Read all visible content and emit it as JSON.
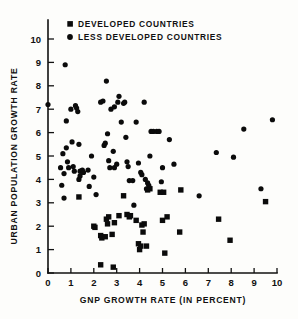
{
  "chart_data": {
    "type": "scatter",
    "title": "",
    "xlabel": "GNP GROWTH RATE  (IN PERCENT)",
    "ylabel": "URBAN POPULATION GROWTH RATE",
    "xlim": [
      0,
      10
    ],
    "ylim": [
      0,
      10.8
    ],
    "xticks": [
      "0",
      "1",
      "2",
      "3",
      "4",
      "5",
      "6",
      "7",
      "8",
      "9",
      "10"
    ],
    "xtick_values": [
      0,
      1,
      2,
      3,
      4,
      5,
      6,
      7,
      8,
      9,
      10
    ],
    "yticks": [
      "0",
      "1",
      "2",
      "3",
      "4",
      "5",
      "6",
      "7",
      "8",
      "9",
      "10"
    ],
    "ytick_values": [
      0,
      1,
      2,
      3,
      4,
      5,
      6,
      7,
      8,
      9,
      10
    ],
    "grid": false,
    "legend_position": "top-center",
    "marker_colors": {
      "developed": "#0b0b0b",
      "less_developed": "#0b0b0b"
    },
    "series": [
      {
        "name": "DEVELOPED COUNTRIES",
        "marker": "square",
        "color": "#0b0b0b",
        "points": [
          [
            1.35,
            3.25
          ],
          [
            2.0,
            2.0
          ],
          [
            2.05,
            1.95
          ],
          [
            2.3,
            0.35
          ],
          [
            2.3,
            1.6
          ],
          [
            2.35,
            1.5
          ],
          [
            2.5,
            1.55
          ],
          [
            2.55,
            2.3
          ],
          [
            2.6,
            2.1
          ],
          [
            2.65,
            2.4
          ],
          [
            2.8,
            1.65
          ],
          [
            2.85,
            0.25
          ],
          [
            2.9,
            2.15
          ],
          [
            3.1,
            2.45
          ],
          [
            3.3,
            3.3
          ],
          [
            3.45,
            2.5
          ],
          [
            3.55,
            2.4
          ],
          [
            3.6,
            2.45
          ],
          [
            3.85,
            2.25
          ],
          [
            3.95,
            1.25
          ],
          [
            4.0,
            1.0
          ],
          [
            4.05,
            1.15
          ],
          [
            4.1,
            2.05
          ],
          [
            4.15,
            1.75
          ],
          [
            4.2,
            2.1
          ],
          [
            4.3,
            1.15
          ],
          [
            4.35,
            3.55
          ],
          [
            4.45,
            3.6
          ],
          [
            4.9,
            3.45
          ],
          [
            5.0,
            2.25
          ],
          [
            5.05,
            3.45
          ],
          [
            5.1,
            0.85
          ],
          [
            5.2,
            2.4
          ],
          [
            5.75,
            1.75
          ],
          [
            5.8,
            3.55
          ],
          [
            7.45,
            2.3
          ],
          [
            7.95,
            1.4
          ],
          [
            9.5,
            3.05
          ]
        ]
      },
      {
        "name": "LESS DEVELOPED COUNTRIES",
        "marker": "circle",
        "color": "#0b0b0b",
        "points": [
          [
            0.0,
            7.2
          ],
          [
            0.55,
            4.5
          ],
          [
            0.6,
            3.75
          ],
          [
            0.65,
            5.1
          ],
          [
            0.7,
            4.25
          ],
          [
            0.7,
            3.2
          ],
          [
            0.75,
            8.9
          ],
          [
            0.8,
            5.35
          ],
          [
            0.8,
            6.5
          ],
          [
            0.85,
            4.75
          ],
          [
            0.9,
            4.5
          ],
          [
            1.0,
            7.0
          ],
          [
            1.05,
            5.6
          ],
          [
            1.1,
            4.55
          ],
          [
            1.15,
            4.35
          ],
          [
            1.2,
            7.15
          ],
          [
            1.25,
            7.05
          ],
          [
            1.3,
            6.9
          ],
          [
            1.35,
            5.5
          ],
          [
            1.35,
            4.0
          ],
          [
            1.4,
            4.15
          ],
          [
            1.4,
            4.35
          ],
          [
            1.45,
            4.35
          ],
          [
            1.5,
            4.4
          ],
          [
            1.55,
            4.3
          ],
          [
            1.75,
            4.4
          ],
          [
            1.8,
            3.7
          ],
          [
            1.9,
            5.0
          ],
          [
            2.0,
            4.1
          ],
          [
            2.1,
            3.35
          ],
          [
            2.3,
            7.3
          ],
          [
            2.4,
            7.35
          ],
          [
            2.45,
            5.45
          ],
          [
            2.5,
            5.55
          ],
          [
            2.55,
            8.2
          ],
          [
            2.6,
            5.95
          ],
          [
            2.65,
            4.8
          ],
          [
            2.7,
            4.5
          ],
          [
            2.75,
            7.0
          ],
          [
            2.85,
            5.2
          ],
          [
            2.9,
            7.1
          ],
          [
            2.9,
            4.5
          ],
          [
            3.0,
            4.65
          ],
          [
            3.05,
            7.3
          ],
          [
            3.1,
            7.55
          ],
          [
            3.2,
            6.45
          ],
          [
            3.3,
            7.25
          ],
          [
            3.35,
            7.3
          ],
          [
            3.4,
            5.8
          ],
          [
            3.45,
            4.75
          ],
          [
            3.5,
            4.55
          ],
          [
            3.55,
            3.95
          ],
          [
            3.7,
            3.95
          ],
          [
            3.75,
            2.9
          ],
          [
            3.85,
            6.45
          ],
          [
            3.95,
            4.7
          ],
          [
            4.05,
            4.3
          ],
          [
            4.1,
            4.2
          ],
          [
            4.2,
            7.3
          ],
          [
            4.25,
            4.0
          ],
          [
            4.3,
            3.6
          ],
          [
            4.35,
            3.85
          ],
          [
            4.4,
            3.75
          ],
          [
            4.45,
            5.0
          ],
          [
            4.5,
            6.05
          ],
          [
            4.6,
            6.05
          ],
          [
            4.75,
            6.05
          ],
          [
            4.85,
            6.05
          ],
          [
            4.95,
            3.9
          ],
          [
            5.0,
            4.5
          ],
          [
            5.3,
            5.7
          ],
          [
            5.5,
            4.65
          ],
          [
            6.6,
            3.3
          ],
          [
            7.35,
            5.15
          ],
          [
            8.1,
            4.95
          ],
          [
            8.55,
            6.15
          ],
          [
            9.3,
            3.6
          ],
          [
            9.8,
            6.55
          ]
        ]
      }
    ]
  },
  "legend": {
    "items": [
      {
        "marker": "square",
        "label": "DEVELOPED COUNTRIES"
      },
      {
        "marker": "circle",
        "label": "LESS DEVELOPED COUNTRIES"
      }
    ]
  }
}
